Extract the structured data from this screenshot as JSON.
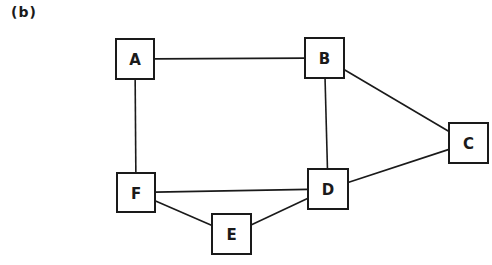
{
  "panel_label": "(b)",
  "colors": {
    "stroke": "#1a1a1a",
    "background": "#ffffff"
  },
  "nodes": [
    {
      "id": "A",
      "label": "A",
      "x": 116,
      "y": 39,
      "w": 38,
      "h": 40
    },
    {
      "id": "B",
      "label": "B",
      "x": 305,
      "y": 38,
      "w": 39,
      "h": 40
    },
    {
      "id": "C",
      "label": "C",
      "x": 449,
      "y": 123,
      "w": 39,
      "h": 40
    },
    {
      "id": "D",
      "label": "D",
      "x": 308,
      "y": 169,
      "w": 40,
      "h": 40
    },
    {
      "id": "E",
      "label": "E",
      "x": 212,
      "y": 214,
      "w": 39,
      "h": 40
    },
    {
      "id": "F",
      "label": "F",
      "x": 117,
      "y": 173,
      "w": 38,
      "h": 39
    }
  ],
  "edges": [
    {
      "from": "A",
      "to": "B"
    },
    {
      "from": "A",
      "to": "F"
    },
    {
      "from": "B",
      "to": "D"
    },
    {
      "from": "B",
      "to": "C"
    },
    {
      "from": "C",
      "to": "D"
    },
    {
      "from": "F",
      "to": "D"
    },
    {
      "from": "F",
      "to": "E"
    },
    {
      "from": "E",
      "to": "D"
    }
  ]
}
